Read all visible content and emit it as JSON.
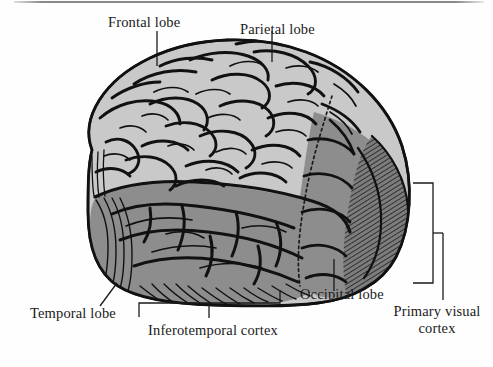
{
  "figure": {
    "kind": "anatomical-illustration",
    "background_color": "#fefefe",
    "ink_color": "#111111",
    "regions": [
      {
        "id": "frontal-parietal",
        "name": "Frontal and parietal lobes",
        "fill": "#c9c9c9"
      },
      {
        "id": "temporal",
        "name": "Temporal lobe",
        "fill": "#8d8d8d"
      },
      {
        "id": "occipital",
        "name": "Occipital lobe",
        "fill": "#8d8d8d"
      },
      {
        "id": "primary-visual",
        "name": "Primary visual cortex",
        "fill": "#7a7a7a"
      },
      {
        "id": "cerebellum",
        "name": "Cerebellum",
        "fill": "#8a8a8a"
      }
    ]
  },
  "labels": {
    "frontal_lobe": "Frontal lobe",
    "parietal_lobe": "Parietal lobe",
    "temporal_lobe": "Temporal lobe",
    "occipital_lobe": "Occipital lobe",
    "inferotemporal_cortex": "Inferotemporal cortex",
    "primary_visual_cortex_line1": "Primary visual",
    "primary_visual_cortex_line2": "cortex"
  }
}
